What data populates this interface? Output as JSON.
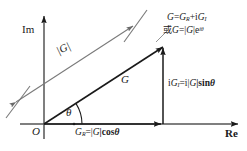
{
  "figure": {
    "type": "phasor-diagram",
    "background_color": "#ffffff",
    "line_color": "#1a1a1a",
    "axes": {
      "imaginary_label": "Im",
      "real_label": "Re",
      "origin_label": "O"
    },
    "labels": {
      "magnitude": "|G|",
      "vector": "G",
      "angle": "θ",
      "equation_rect": {
        "lead": "G",
        "eq": "=",
        "real_sym": "G",
        "real_sub": "R",
        "plus": "+i",
        "imag_sym": "G",
        "imag_sub": "I"
      },
      "equation_polar": {
        "or": "或",
        "lead": "G",
        "eq": "=|",
        "mag": "G",
        "bar": "|e",
        "exp": "iθ"
      },
      "imag_component": {
        "lead": "i",
        "sym": "G",
        "sub": "I",
        "eq": "=i|",
        "mag": "G",
        "tail": "|sin",
        "angle": "θ"
      },
      "real_component": {
        "sym": "G",
        "sub": "R",
        "eq": "=|",
        "mag": "G",
        "tail": "|cos",
        "angle": "θ"
      }
    },
    "geometry": {
      "origin": [
        44,
        124
      ],
      "vector_tip": [
        163,
        46
      ],
      "im_axis_top": [
        44,
        14
      ],
      "re_axis_right": [
        240,
        124
      ],
      "angle_deg": 33,
      "dimension_line_offset": [
        -30,
        -22
      ]
    }
  }
}
